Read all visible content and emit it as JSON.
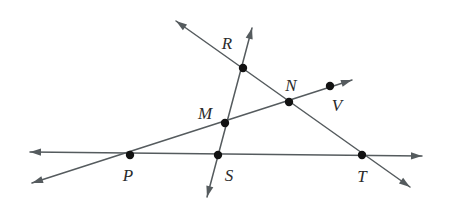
{
  "diagram": {
    "canvas": {
      "width": 456,
      "height": 217
    },
    "colors": {
      "background": "#ffffff",
      "line": "#555b5e",
      "point": "#121212",
      "label": "#2b2b2b"
    },
    "points": [
      {
        "id": "R",
        "label": "R",
        "x": 243,
        "y": 68,
        "label_x": 227,
        "label_y": 43
      },
      {
        "id": "N",
        "label": "N",
        "x": 289,
        "y": 102,
        "label_x": 291,
        "label_y": 85
      },
      {
        "id": "V",
        "label": "V",
        "x": 330,
        "y": 86,
        "label_x": 337,
        "label_y": 105
      },
      {
        "id": "M",
        "label": "M",
        "x": 225,
        "y": 123,
        "label_x": 205,
        "label_y": 113
      },
      {
        "id": "P",
        "label": "P",
        "x": 130,
        "y": 155,
        "label_x": 128,
        "label_y": 175
      },
      {
        "id": "S",
        "label": "S",
        "x": 218,
        "y": 155,
        "label_x": 229,
        "label_y": 175
      },
      {
        "id": "T",
        "label": "T",
        "x": 362,
        "y": 155,
        "label_x": 362,
        "label_y": 176
      }
    ],
    "lines": [
      {
        "id": "line-horizontal-PST",
        "name": "horizontal-line-through-P-S-T",
        "through": [
          "P",
          "S",
          "T"
        ],
        "x1": 30,
        "y1": 152,
        "x2": 422,
        "y2": 156,
        "arrow_start": true,
        "arrow_end": true
      },
      {
        "id": "line-PMNV",
        "name": "line-through-P-M-N-V",
        "through": [
          "P",
          "M",
          "N",
          "V"
        ],
        "x1": 32,
        "y1": 183,
        "x2": 352,
        "y2": 80,
        "arrow_start": true,
        "arrow_end": true
      },
      {
        "id": "line-RMS",
        "name": "line-through-R-M-S",
        "through": [
          "R",
          "M",
          "S"
        ],
        "x1": 252,
        "y1": 28,
        "x2": 207,
        "y2": 197,
        "arrow_start": true,
        "arrow_end": true
      },
      {
        "id": "line-RNT",
        "name": "line-through-R-N-T",
        "through": [
          "R",
          "N",
          "T"
        ],
        "x1": 176,
        "y1": 21,
        "x2": 410,
        "y2": 187,
        "arrow_start": true,
        "arrow_end": true
      }
    ]
  }
}
